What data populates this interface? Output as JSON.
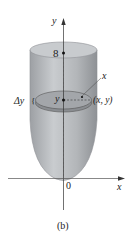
{
  "figure": {
    "caption": "(b)",
    "axis_labels": {
      "y_axis": "y",
      "x_axis": "x",
      "origin": "0"
    },
    "top_level_label": "8",
    "slice": {
      "height_label": "y",
      "thickness_label": "Δy",
      "radius_label": "x",
      "point_label": "(x, y)"
    },
    "colors": {
      "solid_fill": "#b9bcbf",
      "solid_edge": "#8e9195",
      "disk_fill": "#8f9296",
      "top_fill": "#c8cbce",
      "axis": "#333333"
    }
  }
}
